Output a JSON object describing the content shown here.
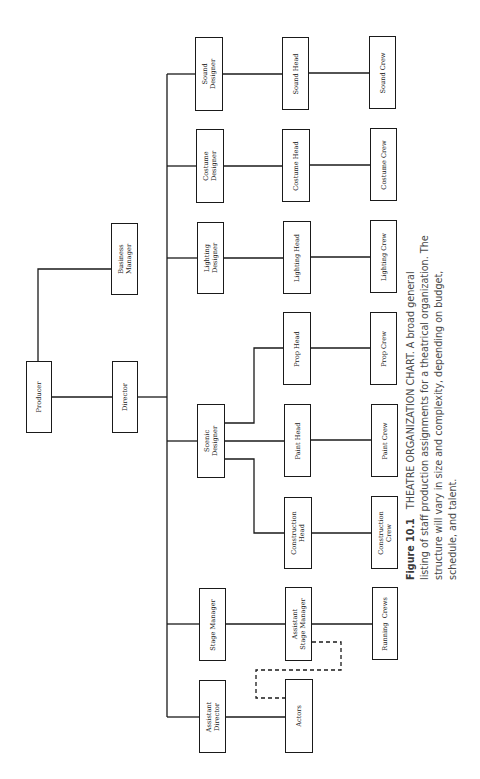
{
  "figure": {
    "label": "Figure 10.1",
    "title": "THEATRE ORGANIZATION CHART.",
    "caption_lines": [
      "A broad general",
      "listing of staff production assignments for a theatrical organization. The",
      "structure will vary in size and complexity, depending on budget,",
      "schedule, and talent."
    ]
  },
  "nodes": {
    "producer": "Producer",
    "business_manager": "Business\nManager",
    "director": "Director",
    "assistant_director": "Assistant\nDirector",
    "stage_manager": "Stage Manager",
    "scenic_designer": "Scenic\nDesigner",
    "lighting_designer": "Lighting\nDesigner",
    "costume_designer": "Costume\nDesigner",
    "sound_designer": "Sound\nDesigner",
    "actors": "Actors",
    "assistant_stage_manager": "Assistant\nStage Manager",
    "construction_head": "Construction\nHead",
    "paint_head": "Paint Head",
    "prop_head": "Prop Head",
    "lighting_head": "Lighting Head",
    "costume_head": "Costume Head",
    "sound_head": "Sound Head",
    "running_crews": "Running  Crews",
    "construction_crew": "Construction\nCrew",
    "paint_crew": "Paint Crew",
    "prop_crew": "Prop Crew",
    "lighting_crew": "Lighting Crew",
    "costume_crew": "Costume Crew",
    "sound_crew": "Sound Crew"
  },
  "edges": [
    [
      "producer",
      "business_manager"
    ],
    [
      "producer",
      "director"
    ],
    [
      "director",
      "assistant_director"
    ],
    [
      "director",
      "stage_manager"
    ],
    [
      "director",
      "scenic_designer"
    ],
    [
      "director",
      "lighting_designer"
    ],
    [
      "director",
      "costume_designer"
    ],
    [
      "director",
      "sound_designer"
    ],
    [
      "assistant_director",
      "actors"
    ],
    [
      "stage_manager",
      "assistant_stage_manager"
    ],
    [
      "assistant_stage_manager",
      "running_crews"
    ],
    [
      "scenic_designer",
      "construction_head"
    ],
    [
      "scenic_designer",
      "paint_head"
    ],
    [
      "scenic_designer",
      "prop_head"
    ],
    [
      "construction_head",
      "construction_crew"
    ],
    [
      "paint_head",
      "paint_crew"
    ],
    [
      "prop_head",
      "prop_crew"
    ],
    [
      "lighting_designer",
      "lighting_head"
    ],
    [
      "lighting_head",
      "lighting_crew"
    ],
    [
      "costume_designer",
      "costume_head"
    ],
    [
      "costume_head",
      "costume_crew"
    ],
    [
      "sound_designer",
      "sound_head"
    ],
    [
      "sound_head",
      "sound_crew"
    ]
  ],
  "dashed_edges": [
    [
      "assistant_stage_manager",
      "actors"
    ]
  ],
  "colors": {
    "line": "#1a1a1a",
    "caption_text": "#4a4a4a"
  }
}
